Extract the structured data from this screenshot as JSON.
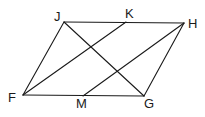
{
  "diagram": {
    "type": "geometry",
    "shape": "parallelogram",
    "stroke_color": "#1a1a1a",
    "points": {
      "J": {
        "label": "J",
        "x": 64,
        "y": 22,
        "lx": 54,
        "ly": 21
      },
      "K": {
        "label": "K",
        "x": 126,
        "y": 22,
        "lx": 125,
        "ly": 18
      },
      "H": {
        "label": "H",
        "x": 184,
        "y": 23,
        "lx": 188,
        "ly": 28
      },
      "F": {
        "label": "F",
        "x": 23,
        "y": 95,
        "lx": 8,
        "ly": 102
      },
      "M": {
        "label": "M",
        "x": 83,
        "y": 96,
        "lx": 76,
        "ly": 108
      },
      "G": {
        "label": "G",
        "x": 144,
        "y": 96,
        "lx": 144,
        "ly": 108
      }
    },
    "segments": [
      {
        "name": "segment-JH",
        "from": "J",
        "to": "H"
      },
      {
        "name": "segment-FG",
        "from": "F",
        "to": "G"
      },
      {
        "name": "segment-FJ",
        "from": "F",
        "to": "J"
      },
      {
        "name": "segment-GH",
        "from": "G",
        "to": "H"
      },
      {
        "name": "segment-FK",
        "from": "F",
        "to": "K"
      },
      {
        "name": "segment-MH",
        "from": "M",
        "to": "H"
      },
      {
        "name": "segment-JG",
        "from": "J",
        "to": "G"
      }
    ]
  }
}
